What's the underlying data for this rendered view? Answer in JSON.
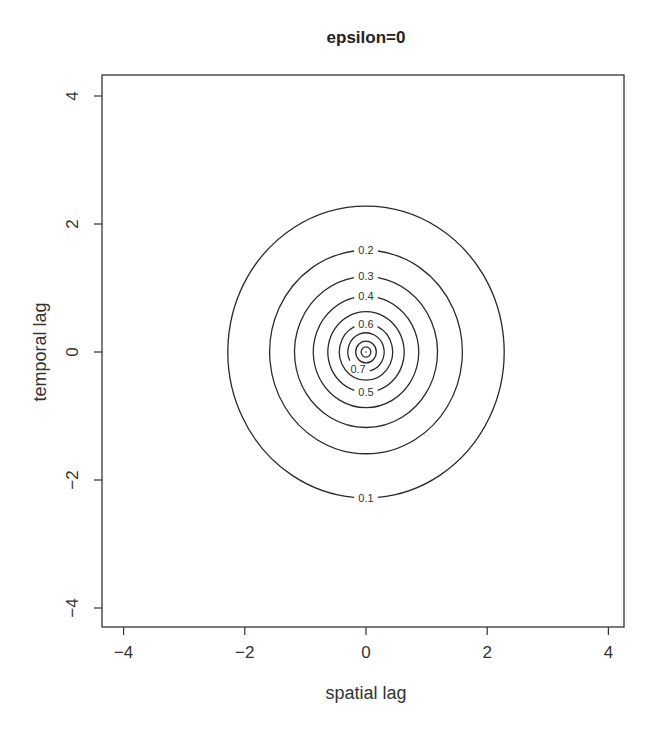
{
  "chart_data": {
    "type": "contour",
    "title": "epsilon=0",
    "xlabel": "spatial lag",
    "ylabel": "temporal lag",
    "xlim": [
      -4.3,
      4.3
    ],
    "ylim": [
      -4.3,
      4.3
    ],
    "x_ticks": [
      -4,
      -2,
      0,
      2,
      4
    ],
    "y_ticks": [
      -4,
      -2,
      0,
      2,
      4
    ],
    "x_tick_labels": [
      "−4",
      "−2",
      "0",
      "2",
      "4"
    ],
    "y_tick_labels": [
      "−4",
      "−2",
      "0",
      "2",
      "4"
    ],
    "grid": false,
    "legend": null,
    "center": [
      0,
      0
    ],
    "contours": [
      {
        "level": 0.1,
        "radius": 2.28,
        "label": "0.1",
        "label_position": "bottom"
      },
      {
        "level": 0.2,
        "radius": 1.59,
        "label": "0.2",
        "label_position": "top"
      },
      {
        "level": 0.3,
        "radius": 1.18,
        "label": "0.3",
        "label_position": "top"
      },
      {
        "level": 0.4,
        "radius": 0.87,
        "label": "0.4",
        "label_position": "top"
      },
      {
        "level": 0.5,
        "radius": 0.63,
        "label": "0.5",
        "label_position": "bottom"
      },
      {
        "level": 0.6,
        "radius": 0.44,
        "label": "0.6",
        "label_position": "top"
      },
      {
        "level": 0.7,
        "radius": 0.3,
        "label": "0.7",
        "label_position": "bottom-left"
      },
      {
        "level": 0.8,
        "radius": 0.17,
        "label": null,
        "label_position": null
      },
      {
        "level": 0.9,
        "radius": 0.08,
        "label": null,
        "label_position": null
      }
    ]
  }
}
